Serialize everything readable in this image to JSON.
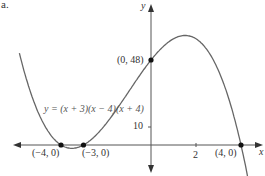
{
  "figure_label": "a.",
  "chart_data": {
    "type": "line",
    "title": "",
    "xlabel": "x",
    "ylabel": "y",
    "equation_label": "y = (x + 3)(x − 4)(x + 4)",
    "xlim": [
      -6.5,
      5
    ],
    "ylim": [
      -15,
      75
    ],
    "x_ticks": [
      {
        "value": 2,
        "label": "2"
      }
    ],
    "y_ticks": [
      {
        "value": 10,
        "label": "10"
      }
    ],
    "grid": false,
    "series": [
      {
        "name": "y = (x + 3)(x − 4)(x + 4)",
        "x": [
          -5.8,
          -5,
          -4,
          -3.5,
          -3,
          -2,
          -1,
          0,
          1,
          1.67,
          2,
          3,
          4,
          4.3
        ],
        "values": [
          54.5,
          18,
          0,
          -1.6,
          0,
          12,
          30,
          48,
          60,
          61.7,
          60,
          42,
          0,
          -17
        ]
      }
    ],
    "points": [
      {
        "x": -4,
        "y": 0,
        "label": "(−4, 0)"
      },
      {
        "x": -3,
        "y": 0,
        "label": "(−3, 0)"
      },
      {
        "x": 0,
        "y": 48,
        "label": "(0, 48)"
      },
      {
        "x": 4,
        "y": 0,
        "label": "(4, 0)"
      }
    ]
  }
}
